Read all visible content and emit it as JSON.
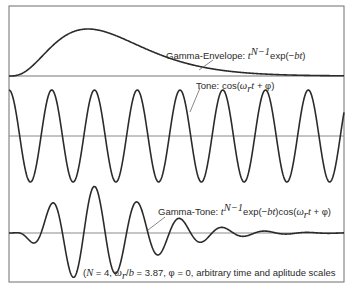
{
  "figure": {
    "frame": {
      "left": 9,
      "top": 6,
      "right": 344,
      "bottom": 282
    },
    "colors": {
      "curve": "#2b2b2b",
      "axis": "#8a8a8a",
      "frame": "#6f6f6f",
      "text": "#2a2a2a"
    },
    "panels": [
      {
        "id": "envelope",
        "label_prefix": "Gamma-Envelope: ",
        "label_formula": "t^(N−1) exp(−bt)",
        "label_parts": {
          "t": "t",
          "sup": "N−1",
          "rest": "exp(−",
          "bt": "bt",
          "close": ")"
        }
      },
      {
        "id": "tone",
        "label_prefix": "Tone: ",
        "label_formula": "cos(ωrt + φ)",
        "label_parts": {
          "fn": "cos(",
          "w": "ω",
          "sub": "r",
          "t": "t",
          "rest": " + φ)"
        }
      },
      {
        "id": "gammatone",
        "label_prefix": "Gamma-Tone: ",
        "label_formula": "t^(N−1) exp(−bt) cos(ωrt + φ)",
        "label_parts": {
          "t": "t",
          "sup": "N−1",
          "exp": "exp(−",
          "bt": "bt",
          "cos": ")cos(",
          "w": "ω",
          "sub": "r",
          "t2": "t",
          "rest": " + φ)"
        }
      }
    ],
    "caption": {
      "open": "(",
      "N": "N",
      "n_val": " = 4, ",
      "w": "ω",
      "sub": "r",
      "slash": "/",
      "b": "b",
      "ratio": " = 3.87, φ = 0, arbitrary time and aplitude scales"
    }
  },
  "chart_data": {
    "type": "line",
    "title": "",
    "parameters": {
      "N": 4,
      "omega_over_b": 3.87,
      "phi": 0
    },
    "xlabel": "time (arbitrary)",
    "ylabel": "amplitude (arbitrary)",
    "grid": false,
    "series": [
      {
        "name": "Gamma-Envelope",
        "formula": "t^(N-1) exp(-bt)",
        "baseline_y": 76,
        "amplitude_px": 47,
        "peak_x": 88
      },
      {
        "name": "Tone",
        "formula": "cos(w_r t + phi)",
        "baseline_y": 136,
        "amplitude_px": 46,
        "period_px": 43.6
      },
      {
        "name": "Gamma-Tone",
        "formula": "t^(N-1) exp(-bt) cos(w_r t + phi)",
        "baseline_y": 233,
        "amplitude_px": 47
      }
    ],
    "x_px_range": [
      9,
      344
    ],
    "envelope_peak_t_px": 79
  }
}
